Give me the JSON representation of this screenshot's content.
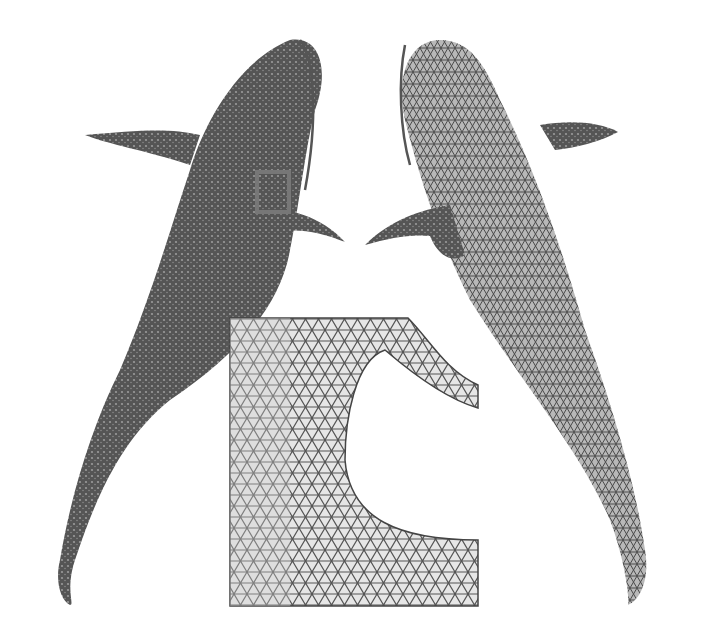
{
  "figure": {
    "panels": [
      {
        "id": "left-fish",
        "description": "Dense mesh of fish (top view), with highlighted selection box near fin"
      },
      {
        "id": "right-fish",
        "description": "Remeshed fish (top view) with visible triangle mesh"
      },
      {
        "id": "inset",
        "description": "Zoomed-in triangle mesh detail of selected region"
      }
    ],
    "colors": {
      "mesh_dark": "#4a4a4a",
      "mesh_mid": "#7a7a7a",
      "mesh_light": "#d8d8d8",
      "selection_box": "#777777",
      "background": "#ffffff"
    }
  }
}
